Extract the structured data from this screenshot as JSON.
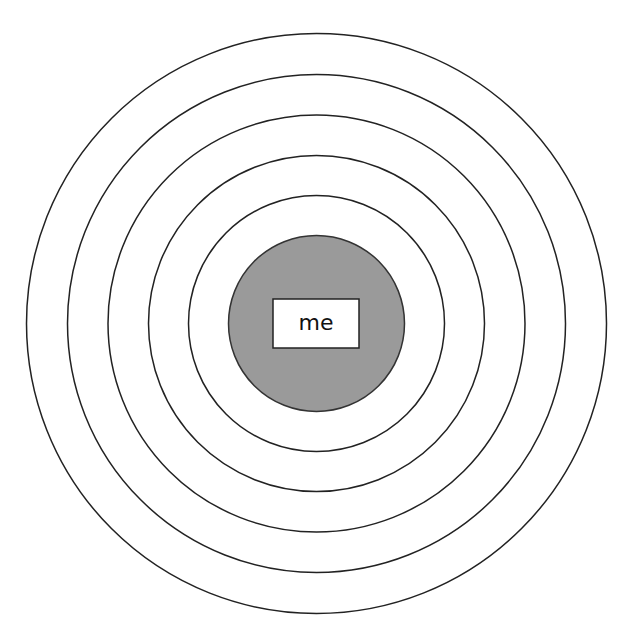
{
  "diagram": {
    "title": "",
    "center": {
      "x": 316.5,
      "y": 323.5
    },
    "rings": [
      {
        "radius": 290,
        "fill": "#ffffff",
        "stroke": "#222222"
      },
      {
        "radius": 249,
        "fill": "#ffffff",
        "stroke": "#222222"
      },
      {
        "radius": 208.5,
        "fill": "#ffffff",
        "stroke": "#222222"
      },
      {
        "radius": 168,
        "fill": "#ffffff",
        "stroke": "#222222"
      },
      {
        "radius": 128,
        "fill": "#ffffff",
        "stroke": "#222222"
      },
      {
        "radius": 88,
        "fill": "#9a9a9a",
        "stroke": "#333333"
      }
    ],
    "center_label": {
      "text": "me",
      "box": {
        "x": 273,
        "y": 299,
        "width": 86,
        "height": 49,
        "fill": "#ffffff",
        "stroke": "#222222"
      }
    }
  }
}
